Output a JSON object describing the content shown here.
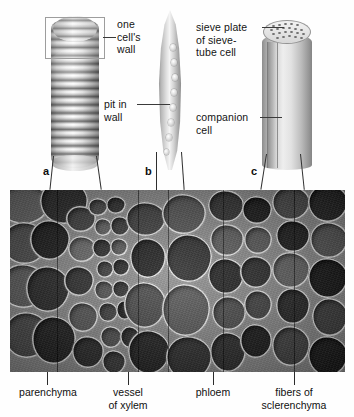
{
  "figure": {
    "type": "botany-diagram"
  },
  "panels": [
    {
      "letter": "a",
      "name": "vessel-element",
      "x": 43,
      "y": 171
    },
    {
      "letter": "b",
      "name": "sclerenchyma-fiber",
      "x": 145,
      "y": 171
    },
    {
      "letter": "c",
      "name": "sieve-tube-cell",
      "x": 251,
      "y": 171
    }
  ],
  "callouts": {
    "one_cells_wall": "one\ncell's\nwall",
    "pit_in_wall": "pit in\nwall",
    "sieve_plate": "sieve plate\nof sieve-\ntube cell",
    "companion_cell": "companion\ncell"
  },
  "bottom_labels": [
    {
      "text": "parenchyma",
      "tick_x": 47,
      "center_x": 47,
      "lines": 1
    },
    {
      "text": "vessel\nof xylem",
      "tick_x": 128,
      "center_x": 128,
      "lines": 2
    },
    {
      "text": "phloem",
      "tick_x": 213,
      "center_x": 213,
      "lines": 1
    },
    {
      "text": "fibers of\nsclerenchyma",
      "tick_x": 294,
      "center_x": 294,
      "lines": 2
    }
  ],
  "colors": {
    "text": "#101010",
    "leader": "#3a3a3a",
    "box_border": "#9d9d9d",
    "micrograph_base": "#8d8d8d"
  },
  "micrograph": {
    "alt": "scanning electron micrograph of plant stem cross section showing parenchyma, xylem vessels, phloem and sclerenchyma fibers",
    "grayscale": true
  }
}
